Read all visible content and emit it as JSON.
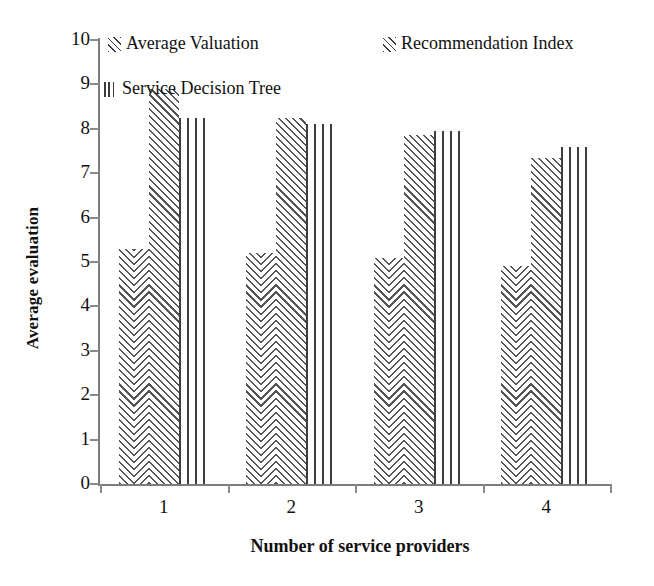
{
  "chart_data": {
    "type": "bar",
    "title": "",
    "xlabel": "Number of service providers",
    "ylabel": "Average evaluation",
    "categories": [
      "1",
      "2",
      "3",
      "4"
    ],
    "ylim": [
      0,
      10
    ],
    "ytick_labels": [
      "0",
      "1",
      "2",
      "3",
      "4",
      "5",
      "6",
      "7",
      "8",
      "9",
      "10"
    ],
    "grid": false,
    "legend_position": "top",
    "series": [
      {
        "name": "Average Valuation",
        "pattern": "chevron",
        "values": [
          5.3,
          5.2,
          5.1,
          4.9
        ]
      },
      {
        "name": "Recommendation Index",
        "pattern": "diagonal-hatch",
        "values": [
          8.9,
          8.25,
          7.85,
          7.35
        ]
      },
      {
        "name": "Service Decision Tree",
        "pattern": "vertical-lines",
        "values": [
          8.25,
          8.1,
          7.95,
          7.6
        ]
      }
    ]
  },
  "legend": {
    "items": [
      {
        "label": "Average Valuation",
        "swatch": "chevron-swatch-icon"
      },
      {
        "label": "Recommendation Index",
        "swatch": "diagonal-swatch-icon"
      },
      {
        "label": "Service Decision Tree",
        "swatch": "vertical-swatch-icon"
      }
    ]
  },
  "axes": {
    "y_title": "Average evaluation",
    "x_title": "Number of service providers"
  }
}
